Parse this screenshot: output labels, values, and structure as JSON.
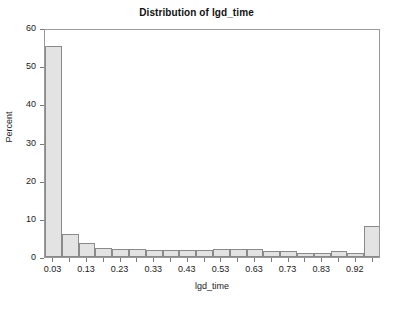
{
  "chart_data": {
    "type": "bar",
    "title": "Distribution of lgd_time",
    "subtitle": "",
    "xlabel": "lgd_time",
    "ylabel": "Percent",
    "ylim": [
      0,
      60
    ],
    "yticks": [
      0,
      10,
      20,
      30,
      40,
      50,
      60
    ],
    "ytick_labels": [
      "0",
      "10",
      "20",
      "30",
      "40",
      "50",
      "60"
    ],
    "grid": false,
    "legend": null,
    "bin_width": 0.05,
    "categories": [
      "0.03",
      "0.08",
      "0.13",
      "0.18",
      "0.23",
      "0.28",
      "0.33",
      "0.38",
      "0.43",
      "0.48",
      "0.53",
      "0.58",
      "0.63",
      "0.68",
      "0.73",
      "0.78",
      "0.83",
      "0.88",
      "0.92",
      "0.97"
    ],
    "values": [
      55.3,
      6.0,
      3.6,
      2.4,
      2.1,
      2.1,
      1.8,
      1.9,
      1.8,
      1.9,
      2.0,
      2.0,
      2.0,
      1.6,
      1.7,
      1.0,
      1.0,
      1.5,
      1.1,
      8.0
    ],
    "xtick_labels": [
      "0.03",
      "0.13",
      "0.23",
      "0.33",
      "0.43",
      "0.53",
      "0.63",
      "0.73",
      "0.83",
      "0.92"
    ],
    "xtick_bin_indices": [
      0,
      2,
      4,
      6,
      8,
      10,
      12,
      14,
      16,
      18
    ],
    "colors": {
      "bar_fill": "#e3e3e3",
      "bar_edge": "#8a8a8a",
      "frame": "#999999",
      "text": "#1a1a1a",
      "background": "#ffffff"
    }
  }
}
